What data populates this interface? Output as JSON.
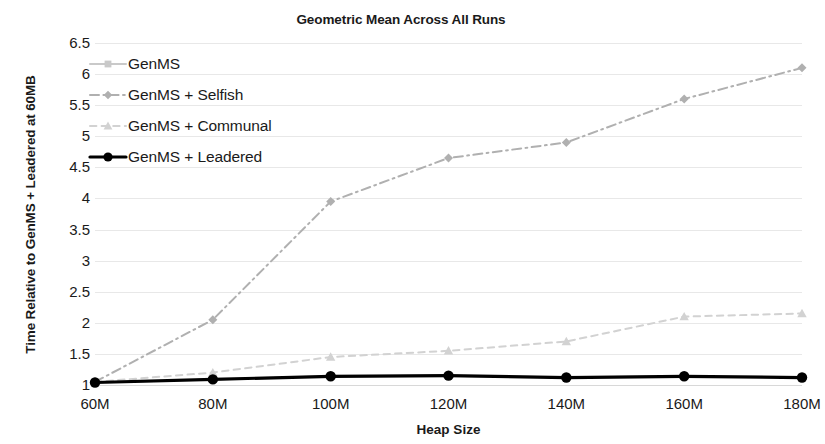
{
  "chart_data": {
    "type": "line",
    "title": "Geometric Mean Across All Runs",
    "xlabel": "Heap Size",
    "ylabel": "Time Relative to GenMS + Leadered at 60MB",
    "categories": [
      "60M",
      "80M",
      "100M",
      "120M",
      "140M",
      "160M",
      "180M"
    ],
    "x_ticks": [
      "60M",
      "80M",
      "100M",
      "120M",
      "140M",
      "160M",
      "180M"
    ],
    "y_ticks": [
      "1",
      "1.5",
      "2",
      "2.5",
      "3",
      "3.5",
      "4",
      "4.5",
      "5",
      "5.5",
      "6",
      "6.5"
    ],
    "ylim": [
      1,
      6.5
    ],
    "grid": true,
    "legend_position": "top-left-inside",
    "series": [
      {
        "name": "GenMS",
        "values": [
          1.04,
          1.09,
          1.14,
          1.15,
          1.12,
          1.14,
          1.12
        ],
        "color": "#c9c9c9",
        "marker": "square",
        "dash": "solid"
      },
      {
        "name": "GenMS + Selfish",
        "values": [
          1.05,
          2.05,
          3.95,
          4.65,
          4.9,
          5.6,
          6.1
        ],
        "color": "#b0b0b0",
        "marker": "diamond",
        "dash": "dash-dot"
      },
      {
        "name": "GenMS + Communal",
        "values": [
          1.05,
          1.2,
          1.45,
          1.55,
          1.7,
          2.1,
          2.15
        ],
        "color": "#d2d2d2",
        "marker": "triangle",
        "dash": "dashed"
      },
      {
        "name": "GenMS + Leadered",
        "values": [
          1.04,
          1.09,
          1.14,
          1.15,
          1.12,
          1.14,
          1.12
        ],
        "color": "#000000",
        "marker": "circle",
        "dash": "solid"
      }
    ]
  },
  "legend": {
    "items": [
      {
        "label": "GenMS"
      },
      {
        "label": "GenMS + Selfish"
      },
      {
        "label": "GenMS + Communal"
      },
      {
        "label": "GenMS + Leadered"
      }
    ]
  },
  "colors": {
    "gridline": "#e8e8e8",
    "axis_text": "#1a1a1a",
    "background": "#ffffff"
  }
}
